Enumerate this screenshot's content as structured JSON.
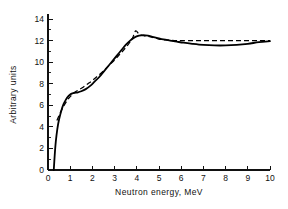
{
  "chart_data": {
    "type": "line",
    "title": "",
    "xlabel": "Neutron energy, MeV",
    "ylabel": "Arbitrary units",
    "xlim": [
      0,
      10
    ],
    "ylim": [
      0,
      14
    ],
    "grid": false,
    "legend": "none",
    "x_ticks": [
      0,
      1,
      2,
      3,
      4,
      5,
      6,
      7,
      8,
      9,
      10
    ],
    "x_tick_labels": [
      "0",
      "1",
      "2",
      "3",
      "4",
      "5",
      "6",
      "7",
      "8",
      "9",
      "10"
    ],
    "y_ticks": [
      0,
      2,
      4,
      6,
      8,
      10,
      12,
      14
    ],
    "y_tick_labels": [
      "0",
      "2",
      "4",
      "6",
      "8",
      "10",
      "12",
      "14"
    ],
    "y_minor_ticks": [
      1,
      3,
      5,
      7,
      9,
      11,
      13
    ],
    "series": [
      {
        "name": "solid-curve",
        "style": "solid",
        "color": "#000000",
        "x": [
          0.26,
          0.3,
          0.35,
          0.42,
          0.5,
          0.6,
          0.7,
          0.8,
          0.9,
          1.0,
          1.1,
          1.2,
          1.35,
          1.5,
          1.7,
          1.9,
          2.1,
          2.3,
          2.5,
          2.7,
          2.9,
          3.1,
          3.3,
          3.5,
          3.7,
          3.9,
          4.1,
          4.3,
          4.5,
          4.7,
          4.9,
          5.2,
          5.5,
          5.8,
          6.1,
          6.5,
          7.0,
          7.5,
          8.0,
          8.5,
          9.0,
          9.5,
          10.0
        ],
        "y": [
          0.0,
          1.3,
          2.6,
          3.8,
          4.7,
          5.5,
          6.1,
          6.5,
          6.8,
          7.0,
          7.1,
          7.15,
          7.2,
          7.3,
          7.5,
          7.8,
          8.2,
          8.6,
          9.1,
          9.6,
          10.1,
          10.6,
          11.1,
          11.6,
          12.0,
          12.3,
          12.45,
          12.5,
          12.45,
          12.35,
          12.25,
          12.1,
          12.0,
          11.9,
          11.8,
          11.7,
          11.6,
          11.55,
          11.55,
          11.6,
          11.7,
          11.85,
          11.95
        ]
      },
      {
        "name": "dashed-curve",
        "style": "dashed",
        "color": "#000000",
        "x": [
          0.4,
          0.55,
          0.7,
          0.85,
          1.0,
          1.2,
          1.4,
          1.6,
          1.8,
          2.0,
          2.2,
          2.4,
          2.6,
          2.8,
          3.0,
          3.2,
          3.4,
          3.6,
          3.8,
          3.95,
          4.1,
          4.3,
          4.5,
          4.7,
          4.9,
          5.1,
          5.4,
          5.7,
          6.0,
          6.5,
          7.0,
          7.5,
          8.0,
          8.5,
          9.0,
          9.5,
          10.0
        ],
        "y": [
          4.6,
          5.3,
          5.9,
          6.4,
          6.8,
          7.2,
          7.45,
          7.7,
          8.0,
          8.3,
          8.65,
          9.0,
          9.4,
          9.8,
          10.2,
          10.65,
          11.1,
          11.6,
          12.2,
          12.9,
          12.6,
          12.45,
          12.4,
          12.3,
          12.2,
          12.1,
          12.05,
          12.0,
          12.0,
          12.0,
          12.0,
          12.0,
          12.0,
          12.0,
          12.0,
          12.0,
          12.0
        ]
      }
    ]
  }
}
